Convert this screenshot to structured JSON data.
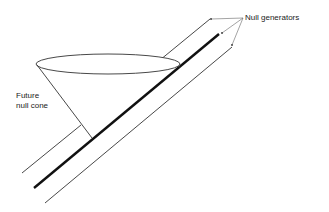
{
  "labels": {
    "null_generators": "Null generators",
    "future_null_cone_line1": "Future",
    "future_null_cone_line2": "null cone"
  },
  "colors": {
    "line": "#222222",
    "pointer": "#555555",
    "background": "#ffffff"
  }
}
